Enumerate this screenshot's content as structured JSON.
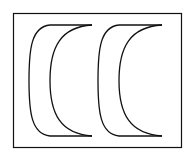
{
  "diagram": {
    "background": "#ffffff",
    "stroke": "#111111",
    "frame": {
      "x": 13.5,
      "y": 13.5,
      "width": 168,
      "height": 134,
      "stroke_width": 1.2
    },
    "shapes": [
      {
        "name": "crescent-left",
        "top_y": 25,
        "bottom_y": 136,
        "outer_left_x": 29,
        "line_start_x": 50,
        "line_end_x": 92,
        "inner_left_x": 50
      },
      {
        "name": "crescent-right",
        "top_y": 25,
        "bottom_y": 136,
        "outer_left_x": 98,
        "line_start_x": 119,
        "line_end_x": 162,
        "inner_left_x": 119
      }
    ]
  }
}
